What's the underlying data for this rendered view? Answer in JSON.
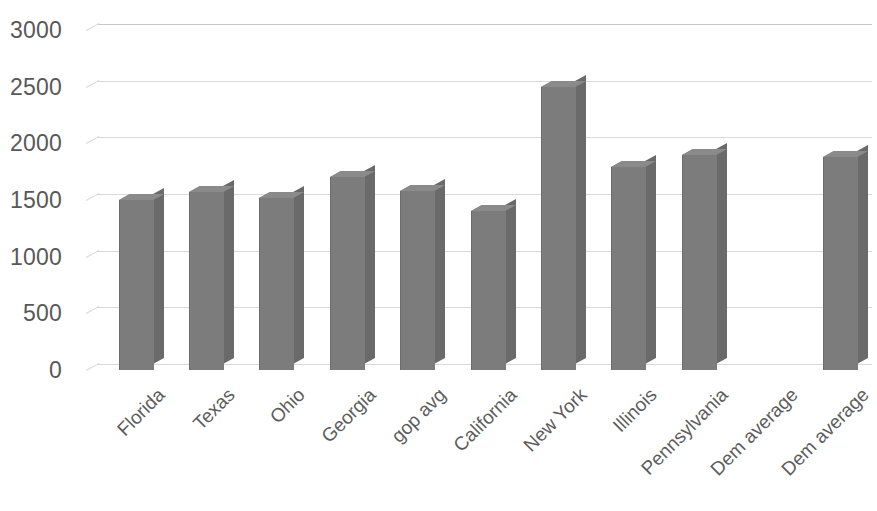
{
  "chart_data": {
    "type": "bar",
    "title": "",
    "subtitle": "",
    "xlabel": "",
    "ylabel": "",
    "categories": [
      "Florida",
      "Texas",
      "Ohio",
      "Georgia",
      "gop avg",
      "California",
      "New York",
      "Illinois",
      "Pennsylvania",
      "Dem average",
      "Dem average"
    ],
    "values": [
      1500,
      1570,
      1520,
      1700,
      1580,
      1400,
      2500,
      1790,
      1900,
      null,
      1880
    ],
    "ylim": [
      0,
      3000
    ],
    "ytick_labels": [
      "3000",
      "2500",
      "2000",
      "1500",
      "1000",
      "500",
      "0"
    ],
    "ytick_values": [
      3000,
      2500,
      2000,
      1500,
      1000,
      500,
      0
    ],
    "ytick_step": 500,
    "grid": true,
    "legend": false,
    "legend_position": "none",
    "style": "3d-column",
    "series": [
      {
        "name": "Series 1",
        "color": "#7c7c7c",
        "values": [
          1500,
          1570,
          1520,
          1700,
          1580,
          1400,
          2500,
          1790,
          1900,
          null,
          1880
        ]
      }
    ]
  },
  "colors": {
    "bar_front": "#7c7c7c",
    "bar_side": "#6a6a6a",
    "bar_top": "#8a8a8a",
    "gridline": "#d9d9d9",
    "axis_text": "#585858",
    "background": "#ffffff"
  }
}
